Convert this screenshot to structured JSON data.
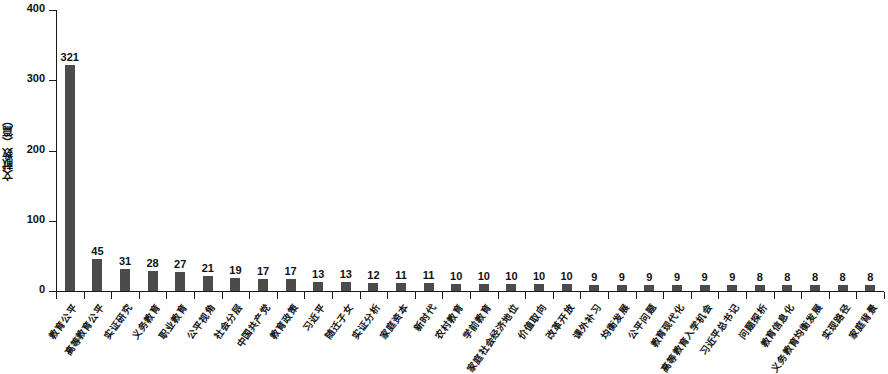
{
  "chart_data": {
    "type": "bar",
    "title": "",
    "xlabel": "",
    "ylabel": "文献数（篇）",
    "ylim": [
      0,
      400
    ],
    "yticks": [
      0,
      100,
      200,
      300,
      400
    ],
    "grid": false,
    "legend": "none",
    "bar_color": "#4b4b4b",
    "axis_color": "#1a1a1a",
    "categories": [
      "教育公平",
      "高等教育公平",
      "实证研究",
      "义务教育",
      "职业教育",
      "公平视角",
      "社会分层",
      "中国共产党",
      "教育政策",
      "习近平",
      "随迁子女",
      "实证分析",
      "家庭资本",
      "新时代",
      "农村教育",
      "学前教育",
      "家庭社会经济地位",
      "价值取向",
      "改革开放",
      "课外补习",
      "均衡发展",
      "公平问题",
      "教育现代化",
      "高等教育入学机会",
      "习近平总书记",
      "问题探析",
      "教育信息化",
      "义务教育均衡发展",
      "实现路径",
      "家庭背景"
    ],
    "values": [
      321,
      45,
      31,
      28,
      27,
      21,
      19,
      17,
      17,
      13,
      13,
      12,
      11,
      11,
      10,
      10,
      10,
      10,
      10,
      9,
      9,
      9,
      9,
      9,
      9,
      8,
      8,
      8,
      8,
      8
    ]
  }
}
